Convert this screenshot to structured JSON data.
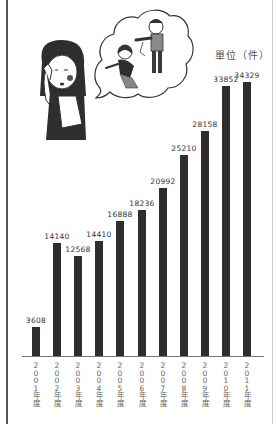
{
  "chart_data": {
    "type": "bar",
    "title": "",
    "unit_label": "單位（件）",
    "xlabel": "",
    "ylabel": "件",
    "categories": [
      "2001年度",
      "2002年度",
      "2003年度",
      "2004年度",
      "2005年度",
      "2006年度",
      "2007年度",
      "2008年度",
      "2009年度",
      "2010年度",
      "2011年度"
    ],
    "values": [
      3608,
      14140,
      12568,
      14410,
      16888,
      18236,
      20992,
      25210,
      28158,
      33852,
      34329
    ],
    "value_labels": [
      "3608",
      "14140",
      "12568",
      "14410",
      "16888",
      "18236",
      "20992",
      "25210",
      "28158",
      "33852",
      "34329"
    ],
    "ylim": [
      0,
      35000
    ],
    "grid": false,
    "legend": "none",
    "bar_color": "#2e2e2e",
    "illustration": "woman-crying-thinking-of-domestic-violence"
  }
}
